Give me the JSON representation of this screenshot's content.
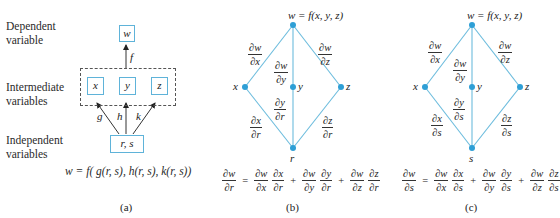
{
  "colors": {
    "edge": "#6cbcdd",
    "node": "#2e9fd6",
    "box_border": "#5fb3d9",
    "arrow": "#333333"
  },
  "panel_a": {
    "row_labels": {
      "dependent": [
        "Dependent",
        "variable"
      ],
      "intermediate": [
        "Intermediate",
        "variables"
      ],
      "independent": [
        "Independent",
        "variables"
      ]
    },
    "boxes": {
      "w": "w",
      "x": "x",
      "y": "y",
      "z": "z",
      "rs": "r, s"
    },
    "edge_labels": {
      "f": "f",
      "g": "g",
      "h": "h",
      "k": "k"
    },
    "formula": "w = f( g(r, s), h(r, s), k(r, s))",
    "caption": "(a)"
  },
  "panel_b": {
    "top_label": "w = f(x, y, z)",
    "nodes": {
      "x": "x",
      "y": "y",
      "z": "z",
      "bottom": "r"
    },
    "upper_edges": {
      "x": {
        "num": "∂w",
        "den": "∂x"
      },
      "y": {
        "num": "∂w",
        "den": "∂y"
      },
      "z": {
        "num": "∂w",
        "den": "∂z"
      }
    },
    "lower_edges": {
      "x": {
        "num": "∂x",
        "den": "∂r"
      },
      "y": {
        "num": "∂y",
        "den": "∂r"
      },
      "z": {
        "num": "∂z",
        "den": "∂r"
      }
    },
    "equation": {
      "lhs": {
        "num": "∂w",
        "den": "∂r"
      },
      "eq": "=",
      "plus": "+",
      "terms": [
        [
          {
            "num": "∂w",
            "den": "∂x"
          },
          {
            "num": "∂x",
            "den": "∂r"
          }
        ],
        [
          {
            "num": "∂w",
            "den": "∂y"
          },
          {
            "num": "∂y",
            "den": "∂r"
          }
        ],
        [
          {
            "num": "∂w",
            "den": "∂z"
          },
          {
            "num": "∂z",
            "den": "∂r"
          }
        ]
      ]
    },
    "caption": "(b)"
  },
  "panel_c": {
    "top_label": "w = f(x, y, z)",
    "nodes": {
      "x": "x",
      "y": "y",
      "z": "z",
      "bottom": "s"
    },
    "upper_edges": {
      "x": {
        "num": "∂w",
        "den": "∂x"
      },
      "y": {
        "num": "∂w",
        "den": "∂y"
      },
      "z": {
        "num": "∂w",
        "den": "∂z"
      }
    },
    "lower_edges": {
      "x": {
        "num": "∂x",
        "den": "∂s"
      },
      "y": {
        "num": "∂y",
        "den": "∂s"
      },
      "z": {
        "num": "∂z",
        "den": "∂s"
      }
    },
    "equation": {
      "lhs": {
        "num": "∂w",
        "den": "∂s"
      },
      "eq": "=",
      "plus": "+",
      "terms": [
        [
          {
            "num": "∂w",
            "den": "∂x"
          },
          {
            "num": "∂x",
            "den": "∂s"
          }
        ],
        [
          {
            "num": "∂w",
            "den": "∂y"
          },
          {
            "num": "∂y",
            "den": "∂s"
          }
        ],
        [
          {
            "num": "∂w",
            "den": "∂z"
          },
          {
            "num": "∂z",
            "den": "∂s"
          }
        ]
      ]
    },
    "caption": "(c)"
  }
}
